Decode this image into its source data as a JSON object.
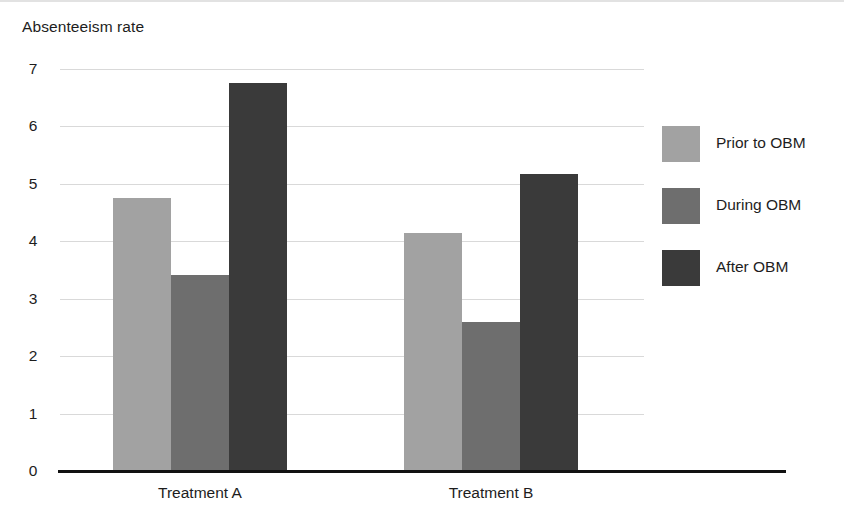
{
  "chart_data": {
    "type": "bar",
    "title": "",
    "ylabel": "Absenteeism rate",
    "xlabel": "",
    "categories": [
      "Treatment A",
      "Treatment B"
    ],
    "series": [
      {
        "name": "Prior to OBM",
        "values": [
          4.75,
          4.15
        ],
        "color": "#a2a2a2"
      },
      {
        "name": "During OBM",
        "values": [
          3.42,
          2.6
        ],
        "color": "#6e6e6e"
      },
      {
        "name": "After OBM",
        "values": [
          6.75,
          5.18
        ],
        "color": "#3a3a3a"
      }
    ],
    "ylim": [
      0,
      7
    ],
    "yticks": [
      "0",
      "1",
      "2",
      "3",
      "4",
      "5",
      "6",
      "7"
    ],
    "grid": true,
    "legend_position": "right"
  },
  "legend": {
    "items": [
      {
        "label": "Prior to OBM"
      },
      {
        "label": "During OBM"
      },
      {
        "label": "After OBM"
      }
    ]
  }
}
